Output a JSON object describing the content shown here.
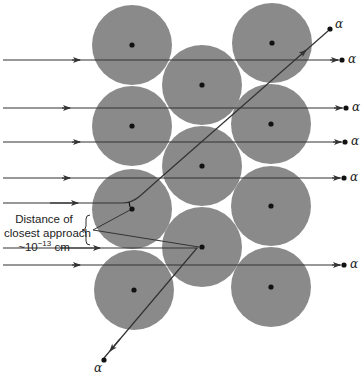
{
  "figure": {
    "colors": {
      "atom_fill": "#8a8a8a",
      "nucleus": "#111111",
      "beam": "#333333",
      "background": "#ffffff"
    },
    "atoms": [
      {
        "cx": 132,
        "cy": 45
      },
      {
        "cx": 272,
        "cy": 43
      },
      {
        "cx": 202,
        "cy": 85
      },
      {
        "cx": 132,
        "cy": 126
      },
      {
        "cx": 271,
        "cy": 124
      },
      {
        "cx": 202,
        "cy": 166
      },
      {
        "cx": 132,
        "cy": 209
      },
      {
        "cx": 271,
        "cy": 206
      },
      {
        "cx": 202,
        "cy": 247
      },
      {
        "cx": 134,
        "cy": 290
      },
      {
        "cx": 271,
        "cy": 287
      }
    ],
    "atom_radius": 40,
    "straight_beams": [
      {
        "y": 60,
        "arrow_x": 80,
        "end_x": 342
      },
      {
        "y": 108,
        "arrow_x": 70,
        "end_x": 346
      },
      {
        "y": 142,
        "arrow_x": 80,
        "end_x": 345
      },
      {
        "y": 178,
        "arrow_x": 70,
        "end_x": 344
      },
      {
        "y": 265,
        "arrow_x": 80,
        "end_x": 344
      }
    ],
    "alpha_label": "α",
    "annotation": {
      "line1": "Distance of",
      "line2": "closest approach",
      "approx": "~10",
      "exponent": "−13",
      "unit": "cm"
    }
  }
}
